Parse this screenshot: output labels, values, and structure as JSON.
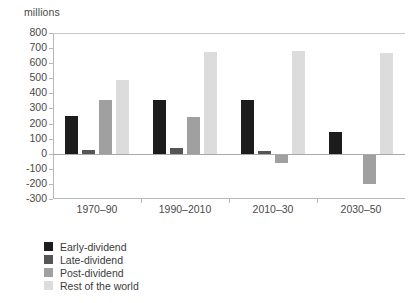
{
  "chart_data": {
    "type": "bar",
    "title": "",
    "subtitle": "",
    "unit_label": "millions",
    "xlabel": "",
    "ylabel": "millions",
    "categories": [
      "1970–90",
      "1990–2010",
      "2010–30",
      "2030–50"
    ],
    "series": [
      {
        "name": "Early-dividend",
        "color": "#1c1c1c",
        "values": [
          250,
          355,
          355,
          145
        ]
      },
      {
        "name": "Late-dividend",
        "color": "#555555",
        "values": [
          25,
          35,
          15,
          0
        ]
      },
      {
        "name": "Post-dividend",
        "color": "#a0a0a0",
        "values": [
          355,
          245,
          -60,
          -200
        ]
      },
      {
        "name": "Rest of the world",
        "color": "#dcdcdc",
        "values": [
          490,
          675,
          680,
          665
        ]
      }
    ],
    "ylim": [
      -300,
      800
    ],
    "yticks": [
      800,
      700,
      600,
      500,
      400,
      300,
      200,
      100,
      0,
      -100,
      -200,
      -300
    ],
    "ytick_labels": [
      "800",
      "700",
      "600",
      "500",
      "400",
      "300",
      "200",
      "100",
      "0",
      "-100",
      "-200",
      "-300"
    ],
    "grid": false,
    "zero_line": true,
    "legend_position": "bottom-left",
    "legend_entries": [
      "Early-dividend",
      "Late-dividend",
      "Post-dividend",
      "Rest of the world"
    ]
  },
  "colors": {
    "background": "#ffffff",
    "axis": "#b8b8b8",
    "text": "#4a4a4a",
    "zero_line": "#a9a9a9"
  }
}
